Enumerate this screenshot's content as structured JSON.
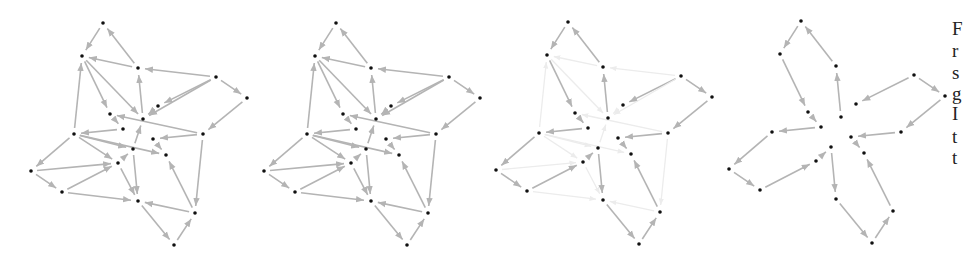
{
  "figure": {
    "panels": [
      {
        "id": "panel-1",
        "label": "full-graph",
        "offset_x": 0,
        "offset_y": 0,
        "mode": "all"
      },
      {
        "id": "panel-2",
        "label": "full-graph-copy",
        "offset_x": 233,
        "offset_y": 0,
        "mode": "all"
      },
      {
        "id": "panel-3",
        "label": "highlighted-subgraph",
        "offset_x": 465,
        "offset_y": -1,
        "mode": "highlight"
      },
      {
        "id": "panel-4",
        "label": "pinwheel-subgraph",
        "offset_x": 698,
        "offset_y": -2,
        "mode": "subgraph"
      }
    ],
    "colors": {
      "edge": "#b4b4b4",
      "edge_faint": "#ececec",
      "edge_strong": "#a8a8a8",
      "node": "#111111"
    },
    "nodes": {
      "A": [
        103,
        23
      ],
      "B": [
        82,
        56
      ],
      "C": [
        138,
        68
      ],
      "D": [
        216,
        77
      ],
      "E": [
        247,
        98
      ],
      "F": [
        158,
        106
      ],
      "G": [
        110,
        114
      ],
      "H": [
        143,
        119
      ],
      "I": [
        123,
        129
      ],
      "J": [
        74,
        134
      ],
      "K": [
        203,
        134
      ],
      "L": [
        153,
        139
      ],
      "M": [
        133,
        149
      ],
      "N": [
        166,
        155
      ],
      "O": [
        118,
        163
      ],
      "P": [
        31,
        171
      ],
      "Q": [
        62,
        192
      ],
      "R": [
        138,
        201
      ],
      "S": [
        195,
        213
      ],
      "T": [
        174,
        245
      ]
    },
    "edges": [
      {
        "from": "A",
        "to": "B",
        "strong": true
      },
      {
        "from": "C",
        "to": "A",
        "strong": true
      },
      {
        "from": "B",
        "to": "G",
        "strong": true
      },
      {
        "from": "H",
        "to": "C",
        "strong": true
      },
      {
        "from": "D",
        "to": "F",
        "strong": true
      },
      {
        "from": "D",
        "to": "E",
        "strong": true
      },
      {
        "from": "E",
        "to": "K",
        "strong": true
      },
      {
        "from": "G",
        "to": "I",
        "strong": true
      },
      {
        "from": "I",
        "to": "J",
        "strong": true
      },
      {
        "from": "J",
        "to": "P",
        "strong": true
      },
      {
        "from": "P",
        "to": "Q",
        "strong": true
      },
      {
        "from": "Q",
        "to": "O",
        "strong": true
      },
      {
        "from": "O",
        "to": "M",
        "strong": true
      },
      {
        "from": "M",
        "to": "R",
        "strong": true
      },
      {
        "from": "R",
        "to": "T",
        "strong": true
      },
      {
        "from": "T",
        "to": "S",
        "strong": true
      },
      {
        "from": "S",
        "to": "N",
        "strong": true
      },
      {
        "from": "L",
        "to": "N",
        "strong": true
      },
      {
        "from": "K",
        "to": "L",
        "strong": true
      },
      {
        "from": "F",
        "to": "H",
        "strong": false
      },
      {
        "from": "C",
        "to": "B",
        "strong": false
      },
      {
        "from": "B",
        "to": "H",
        "strong": false
      },
      {
        "from": "J",
        "to": "B",
        "strong": false
      },
      {
        "from": "D",
        "to": "C",
        "strong": false
      },
      {
        "from": "D",
        "to": "H",
        "strong": false
      },
      {
        "from": "K",
        "to": "G",
        "strong": false
      },
      {
        "from": "J",
        "to": "M",
        "strong": false
      },
      {
        "from": "J",
        "to": "N",
        "strong": false
      },
      {
        "from": "J",
        "to": "O",
        "strong": false
      },
      {
        "from": "P",
        "to": "O",
        "strong": false
      },
      {
        "from": "Q",
        "to": "R",
        "strong": false
      },
      {
        "from": "O",
        "to": "R",
        "strong": false
      },
      {
        "from": "M",
        "to": "H",
        "strong": false
      },
      {
        "from": "S",
        "to": "R",
        "strong": false
      },
      {
        "from": "K",
        "to": "S",
        "strong": false
      }
    ],
    "node_radius": 1.8,
    "caption_fragment": [
      "F",
      "r",
      "s",
      "g",
      "I",
      "t",
      "t"
    ],
    "caption_line_tops": [
      19,
      41,
      63,
      84,
      104,
      127,
      148
    ]
  }
}
